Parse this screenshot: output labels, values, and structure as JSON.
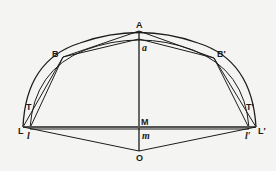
{
  "figure": {
    "colors": {
      "background": "#f4f4f2",
      "ink": "#1c1c1c"
    },
    "labels": {
      "A": "A",
      "a": "a",
      "B": "B",
      "B_prime": "B′",
      "T": "T",
      "T_prime": "T′",
      "L": "L",
      "l": "l",
      "L_prime": "L′",
      "l_prime": "l′",
      "M": "M",
      "m": "m",
      "O": "O"
    },
    "points": {
      "A": [
        139,
        31
      ],
      "a": [
        139,
        39
      ],
      "B": [
        63,
        57
      ],
      "B_prime": [
        214,
        58
      ],
      "T": [
        30,
        108
      ],
      "T_prime": [
        249,
        108
      ],
      "L": [
        23,
        127
      ],
      "l": [
        30,
        128
      ],
      "L_prime": [
        256,
        127
      ],
      "l_prime": [
        249,
        128
      ],
      "M": [
        139,
        127
      ],
      "m": [
        139,
        129
      ],
      "O": [
        139,
        151
      ]
    }
  }
}
